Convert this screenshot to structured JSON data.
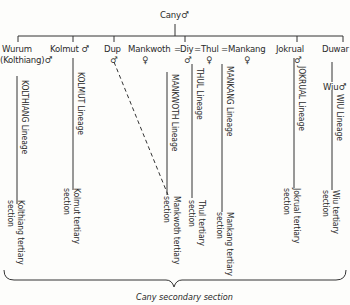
{
  "root": {
    "name": "Cany",
    "sex": "♂"
  },
  "children": [
    {
      "id": "wurum",
      "name": "Wurum",
      "alias": "(Kolthiang)",
      "sex": "♂",
      "lineage": "KOLTHIANG Lineage",
      "section": [
        "Kolthiang tertiary",
        "section"
      ]
    },
    {
      "id": "kolmut",
      "name": "Kolmut",
      "sex": "♂",
      "lineage": "KOLMUT Lineage",
      "section": [
        "Kolmut tertiary",
        "section"
      ]
    },
    {
      "id": "dup",
      "name": "Dup",
      "sex": "♂"
    },
    {
      "id": "mankwoth",
      "name": "Mankwoth",
      "sex": "♀",
      "lineage": "MANKWOTH Lineage",
      "section": [
        "Mankwoth tertiary",
        "section"
      ]
    },
    {
      "id": "diy",
      "name": "Diy",
      "sex": "♂"
    },
    {
      "id": "thul",
      "name": "Thul",
      "sex": "♀",
      "lineage": "THUL Lineage",
      "section": [
        "Thul tertiary",
        "section"
      ]
    },
    {
      "id": "mankang",
      "name": "Mankang",
      "sex": "♀",
      "lineage": "MANKANG Lineage",
      "section": [
        "Mankang tertiary",
        "section"
      ]
    },
    {
      "id": "jokrual",
      "name": "Jokrual",
      "sex": "♂",
      "lineage": "JOKRUAL Lineage",
      "section": [
        "Jokrual tertiary",
        "section"
      ]
    },
    {
      "id": "duwar",
      "name": "Duwar"
    },
    {
      "id": "wiu",
      "name": "Wiu",
      "sex": "♂",
      "lineage": "WIU Lineage",
      "section": [
        "Wiu tertiary",
        "section"
      ]
    }
  ],
  "marriage_sign": "=",
  "caption": "Cany secondary section",
  "colors": {
    "ink": "#2a2a2a",
    "paper": "#fdfdfb"
  }
}
